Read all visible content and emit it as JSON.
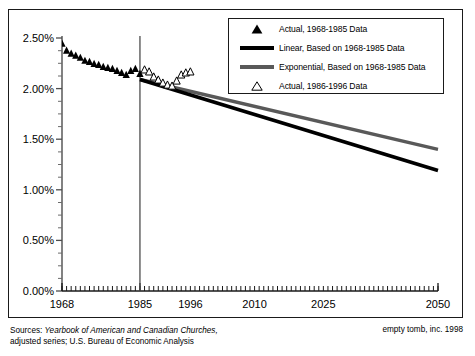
{
  "chart_data": {
    "type": "scatter",
    "title": "",
    "xlabel": "",
    "ylabel": "",
    "xlim": [
      1968,
      2050
    ],
    "ylim": [
      0,
      2.5
    ],
    "grid": false,
    "legend_position": "top-right",
    "y_ticks": [
      "0.00%",
      "0.50%",
      "1.00%",
      "1.50%",
      "2.00%",
      "2.50%"
    ],
    "y_tick_values": [
      0.0,
      0.5,
      1.0,
      1.5,
      2.0,
      2.5
    ],
    "x_ticks": [
      "1968",
      "1985",
      "1996",
      "2010",
      "2025",
      "2050"
    ],
    "x_tick_values": [
      1968,
      1985,
      1996,
      2010,
      2025,
      2050
    ],
    "reference_line_year": 1985,
    "series": [
      {
        "name": "Actual, 1968-1985 Data",
        "marker": "filled-triangle",
        "color": "#000000",
        "x": [
          1968,
          1969,
          1970,
          1971,
          1972,
          1973,
          1974,
          1975,
          1976,
          1977,
          1978,
          1979,
          1980,
          1981,
          1982,
          1983,
          1984,
          1985
        ],
        "values": [
          2.45,
          2.38,
          2.35,
          2.33,
          2.31,
          2.28,
          2.27,
          2.25,
          2.24,
          2.22,
          2.21,
          2.2,
          2.18,
          2.16,
          2.14,
          2.18,
          2.2,
          2.15
        ]
      },
      {
        "name": "Actual, 1986-1996 Data",
        "marker": "open-triangle",
        "color": "#000000",
        "x": [
          1986,
          1987,
          1988,
          1989,
          1990,
          1991,
          1992,
          1993,
          1994,
          1995,
          1996
        ],
        "values": [
          2.19,
          2.17,
          2.12,
          2.09,
          2.06,
          2.04,
          2.03,
          2.08,
          2.14,
          2.16,
          2.17
        ]
      },
      {
        "name": "Linear, Based on 1968-1985 Data",
        "marker": "line",
        "color": "#000000",
        "x": [
          1985,
          2050
        ],
        "values": [
          2.09,
          1.19
        ]
      },
      {
        "name": "Exponential, Based on 1968-1985 Data",
        "marker": "line",
        "color": "#595959",
        "x": [
          1985,
          2050
        ],
        "values": [
          2.09,
          1.4
        ]
      }
    ]
  },
  "legend": {
    "items": [
      {
        "label": "Actual, 1968-1985 Data",
        "mark": "filled-triangle-icon"
      },
      {
        "label": "Linear, Based on 1968-1985 Data",
        "mark": "black-line-icon"
      },
      {
        "label": "Exponential, Based on 1968-1985 Data",
        "mark": "gray-line-icon"
      },
      {
        "label": "Actual, 1986-1996 Data",
        "mark": "open-triangle-icon"
      }
    ]
  },
  "footer": {
    "sources_prefix": "Sources: ",
    "sources_italic": "Yearbook of American and Canadian Churches,",
    "sources_line2": "adjusted series; U.S. Bureau of Economic Analysis",
    "credit": "empty tomb, inc. 1998"
  }
}
